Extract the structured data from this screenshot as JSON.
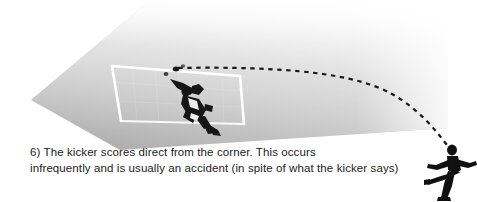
{
  "figure": {
    "caption_number": "6)",
    "caption_line_1": "6) The kicker scores direct from the corner. This occurs",
    "caption_line_2": "infrequently and is usually an accident (in spite of what the kicker says)",
    "caption_full": "6) The kicker scores direct from the corner. This occurs\ninfrequently and is usually an accident (in spite of what the kicker says)"
  },
  "colors": {
    "background": "#ffffff",
    "pitch_near": "#b0b0b0",
    "pitch_mid": "#bdbdbd",
    "pitch_far": "#f2f2f2",
    "goal_frame": "#ffffff",
    "figure_silhouette": "#111111",
    "trajectory": "#1a1a1a",
    "text": "#1c1c1c"
  },
  "elements": {
    "pitch_label": "football pitch corner area",
    "goal_label": "goal with net frame",
    "goalkeeper_label": "diving goalkeeper",
    "kicker_label": "corner kicker striking the ball",
    "ball_label": "ball",
    "trajectory_label": "dashed ball flight path from corner into goal"
  },
  "geometry": {
    "pitch_polygon": "31,100 150,0 448,0 448,128 120,150",
    "goal_posts": {
      "left_top": "112,66",
      "left_bottom": "121,121",
      "right_top": "240,76",
      "right_bottom": "244,124"
    },
    "trajectory_points": "452,152 430,120 400,96 360,80 320,71 280,67 240,66 200,67 176,69"
  }
}
